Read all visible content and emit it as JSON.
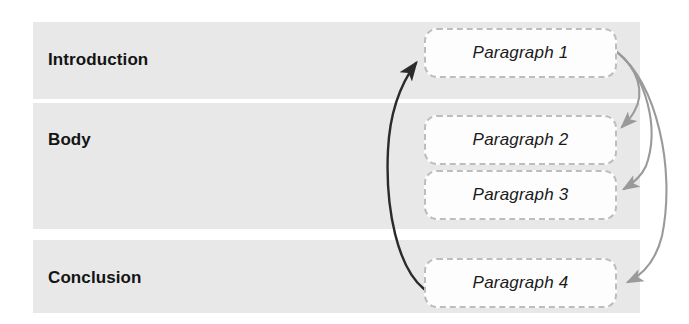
{
  "diagram": {
    "background_color": "#ffffff",
    "band_color": "#e8e8e8",
    "sections": [
      {
        "id": "introduction",
        "label": "Introduction"
      },
      {
        "id": "body",
        "label": "Body"
      },
      {
        "id": "conclusion",
        "label": "Conclusion"
      }
    ],
    "paragraphs": [
      {
        "id": "paragraph-1",
        "label": "Paragraph 1",
        "section": "introduction"
      },
      {
        "id": "paragraph-2",
        "label": "Paragraph 2",
        "section": "body"
      },
      {
        "id": "paragraph-3",
        "label": "Paragraph 3",
        "section": "body"
      },
      {
        "id": "paragraph-4",
        "label": "Paragraph 4",
        "section": "conclusion"
      }
    ],
    "box_style": {
      "border_color": "#bdbdbd",
      "fill_color": "#fdfdfd",
      "border_style": "dashed"
    },
    "connectors": [
      {
        "id": "return-arrow",
        "from": "paragraph-4",
        "to": "paragraph-1",
        "color": "#2b2b2b",
        "side": "left",
        "description": "dark curved arrow from Paragraph 4 back up to Paragraph 1"
      },
      {
        "id": "forward-arrow-1-to-2",
        "from": "paragraph-1",
        "to": "paragraph-2",
        "color": "#9a9a9a",
        "side": "right",
        "description": "gray curved arrow from Paragraph 1 to Paragraph 2"
      },
      {
        "id": "forward-arrow-1-to-3",
        "from": "paragraph-1",
        "to": "paragraph-3",
        "color": "#9a9a9a",
        "side": "right",
        "description": "gray curved arrow from Paragraph 1 to Paragraph 3"
      },
      {
        "id": "forward-arrow-1-to-4",
        "from": "paragraph-1",
        "to": "paragraph-4",
        "color": "#9a9a9a",
        "side": "right",
        "description": "gray curved arrow from Paragraph 1 to Paragraph 4"
      }
    ]
  }
}
